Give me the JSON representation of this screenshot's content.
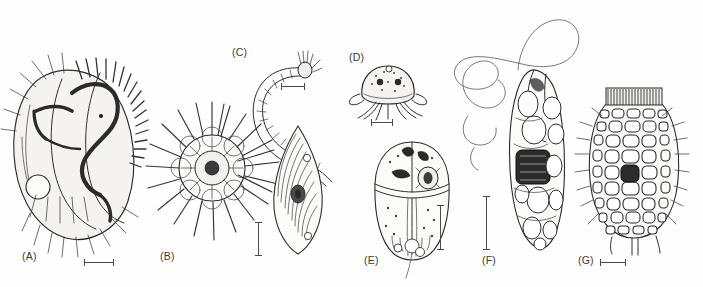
{
  "figure": {
    "type": "scientific-illustration-plate",
    "background_color": "#ffffff",
    "ink_color": "#2b2b2b",
    "panel_count": 7
  },
  "panels": [
    {
      "id": "A",
      "label": "(A)",
      "subject": "hypotrich-ciliate",
      "label_x": 22,
      "label_y": 258,
      "scalebar": {
        "orientation": "horizontal",
        "x": 84,
        "y": 262,
        "length": 30
      }
    },
    {
      "id": "B",
      "label": "(B)",
      "subject": "heliozoan-with-radiating-axopodia",
      "label_x": 160,
      "label_y": 258,
      "scalebar": {
        "orientation": "vertical",
        "x": 258,
        "y": 222,
        "length": 34
      }
    },
    {
      "id": "C",
      "label": "(C)",
      "subject": "curved-ciliate-and-leaf-shaped-flagellate",
      "label_x": 232,
      "label_y": 52,
      "scalebar": {
        "orientation": "horizontal",
        "x": 281,
        "y": 86,
        "length": 24
      }
    },
    {
      "id": "D",
      "label": "(D)",
      "subject": "testate-amoeba-with-pseudopodia",
      "label_x": 349,
      "label_y": 57,
      "scalebar": {
        "orientation": "horizontal",
        "x": 371,
        "y": 122,
        "length": 22
      }
    },
    {
      "id": "E",
      "label": "(E)",
      "subject": "dinoflagellate-with-cingulum",
      "label_x": 364,
      "label_y": 262,
      "scalebar": {
        "orientation": "vertical",
        "x": 440,
        "y": 205,
        "length": 45
      }
    },
    {
      "id": "F",
      "label": "(F)",
      "subject": "euglenoid-with-long-flagellum",
      "label_x": 482,
      "label_y": 262,
      "scalebar": {
        "orientation": "vertical",
        "x": 486,
        "y": 196,
        "length": 54
      }
    },
    {
      "id": "G",
      "label": "(G)",
      "subject": "tintinnid-ciliate-with-plated-lorica",
      "label_x": 578,
      "label_y": 262,
      "scalebar": {
        "orientation": "horizontal",
        "x": 600,
        "y": 262,
        "length": 26
      }
    }
  ]
}
